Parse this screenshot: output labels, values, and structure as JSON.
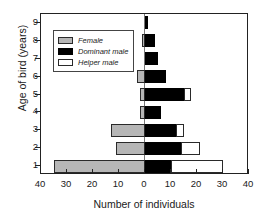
{
  "chart_data": {
    "type": "bar",
    "title": "",
    "subtitle": "",
    "orientation": "horizontal",
    "style": "population-pyramid-stacked",
    "xlabel": "Number of individuals",
    "ylabel": "Age of bird (years)",
    "xlim": [
      -40,
      40
    ],
    "ylim": [
      0.5,
      9.5
    ],
    "xticks": [
      -40,
      -30,
      -20,
      -10,
      0,
      10,
      20,
      30,
      40
    ],
    "xticklabels": [
      "40",
      "30",
      "20",
      "10",
      "0",
      "10",
      "20",
      "30",
      "40"
    ],
    "yticks": [
      1,
      2,
      3,
      4,
      5,
      6,
      7,
      8,
      9
    ],
    "yticklabels": [
      "1",
      "2",
      "3",
      "4",
      "5",
      "6",
      "7",
      "8",
      "9"
    ],
    "grid": false,
    "legend_position": "upper-left-inside",
    "categories": [
      "1",
      "2",
      "3",
      "4",
      "5",
      "6",
      "7",
      "8",
      "9"
    ],
    "series": [
      {
        "name": "Female",
        "side": "left",
        "color": "#b6b6b6",
        "values": [
          35,
          11,
          13,
          2,
          2,
          3,
          0,
          1,
          0
        ]
      },
      {
        "name": "Dominant male",
        "side": "right",
        "color": "#000000",
        "values": [
          10,
          14,
          12,
          6,
          15,
          8,
          5,
          4,
          1
        ]
      },
      {
        "name": "Helper male",
        "side": "right",
        "color": "#ffffff",
        "values": [
          20,
          7,
          3,
          0,
          2.5,
          0,
          0,
          0,
          0
        ]
      }
    ]
  },
  "axes": {
    "x_label": "Number of individuals",
    "y_label": "Age of bird (years)"
  },
  "legend": {
    "items": [
      {
        "label": "Female",
        "swatch": "female"
      },
      {
        "label": "Dominant male",
        "swatch": "dominant"
      },
      {
        "label": "Helper male",
        "swatch": "helper"
      }
    ]
  },
  "colors": {
    "female": "#b6b6b6",
    "dominant_male": "#000000",
    "helper_male": "#ffffff",
    "axis": "#222222",
    "center_line": "#777777",
    "background": "#ffffff"
  }
}
